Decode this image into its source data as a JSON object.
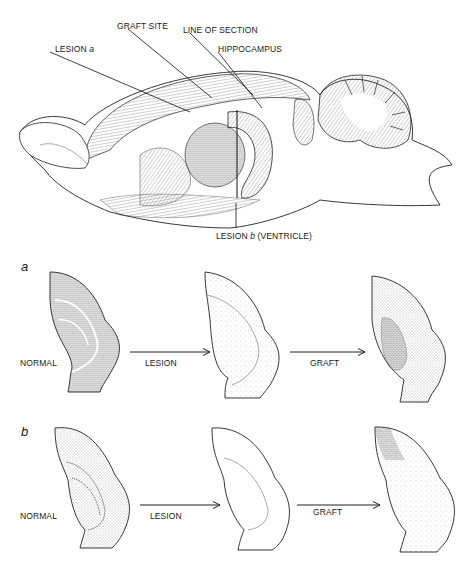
{
  "figure": {
    "brain_labels": {
      "graft_site": "GRAFT SITE",
      "line_of_section": "LINE OF SECTION",
      "hippocampus": "HIPPOCAMPUS",
      "lesion_a_prefix": "LESION ",
      "lesion_a_letter": "a",
      "lesion_b_prefix": "LESION ",
      "lesion_b_letter": "b",
      "lesion_b_suffix": " (VENTRICLE)"
    },
    "panels": [
      {
        "letter": "a",
        "stages": [
          "NORMAL",
          "LESION",
          "GRAFT"
        ]
      },
      {
        "letter": "b",
        "stages": [
          "NORMAL",
          "LESION",
          "GRAFT"
        ]
      }
    ]
  }
}
